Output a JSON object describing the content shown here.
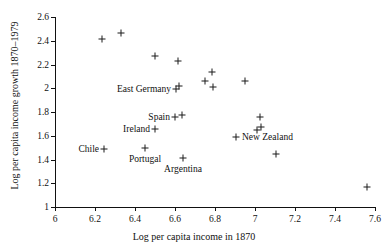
{
  "chart_data": {
    "type": "scatter",
    "title": "",
    "xlabel": "Log per capita income in 1870",
    "ylabel": "Log per capita income growth 1870–1979",
    "xlim": [
      6,
      7.6
    ],
    "ylim": [
      1,
      2.6
    ],
    "xticks": [
      "6",
      "6.2",
      "6.4",
      "6.6",
      "6.8",
      "7",
      "7.2",
      "7.4",
      "7.6"
    ],
    "xtick_values": [
      6,
      6.2,
      6.4,
      6.6,
      6.8,
      7.0,
      7.2,
      7.4,
      7.6
    ],
    "yticks": [
      "1",
      "1.2",
      "1.4",
      "1.6",
      "1.8",
      "2",
      "2.2",
      "2.4",
      "2.6"
    ],
    "ytick_values": [
      1,
      1.2,
      1.4,
      1.6,
      1.8,
      2.0,
      2.2,
      2.4,
      2.6
    ],
    "grid": false,
    "legend": "none",
    "marker": "plus",
    "marker_color": "#1a1a1a",
    "points": [
      {
        "x": 6.235,
        "y": 2.415,
        "label": ""
      },
      {
        "x": 6.33,
        "y": 2.465,
        "label": ""
      },
      {
        "x": 6.5,
        "y": 2.275,
        "label": ""
      },
      {
        "x": 6.615,
        "y": 2.23,
        "label": ""
      },
      {
        "x": 6.62,
        "y": 2.02,
        "label": ""
      },
      {
        "x": 6.605,
        "y": 1.995,
        "label": "East Germany",
        "label_side": "left"
      },
      {
        "x": 6.75,
        "y": 2.06,
        "label": ""
      },
      {
        "x": 6.785,
        "y": 2.14,
        "label": ""
      },
      {
        "x": 6.79,
        "y": 2.01,
        "label": ""
      },
      {
        "x": 6.95,
        "y": 2.065,
        "label": ""
      },
      {
        "x": 6.6,
        "y": 1.755,
        "label": "Spain",
        "label_side": "left"
      },
      {
        "x": 6.635,
        "y": 1.775,
        "label": ""
      },
      {
        "x": 6.5,
        "y": 1.66,
        "label": "Ireland",
        "label_side": "left"
      },
      {
        "x": 7.025,
        "y": 1.755,
        "label": ""
      },
      {
        "x": 7.01,
        "y": 1.65,
        "label": ""
      },
      {
        "x": 7.03,
        "y": 1.675,
        "label": ""
      },
      {
        "x": 6.905,
        "y": 1.59,
        "label": "New Zealand",
        "label_side": "right"
      },
      {
        "x": 6.245,
        "y": 1.49,
        "label": "Chile",
        "label_side": "left"
      },
      {
        "x": 6.45,
        "y": 1.5,
        "label": "Portugal",
        "label_side": "below"
      },
      {
        "x": 6.64,
        "y": 1.415,
        "label": "Argentina",
        "label_side": "below"
      },
      {
        "x": 7.105,
        "y": 1.45,
        "label": ""
      },
      {
        "x": 7.56,
        "y": 1.168,
        "label": ""
      }
    ]
  }
}
